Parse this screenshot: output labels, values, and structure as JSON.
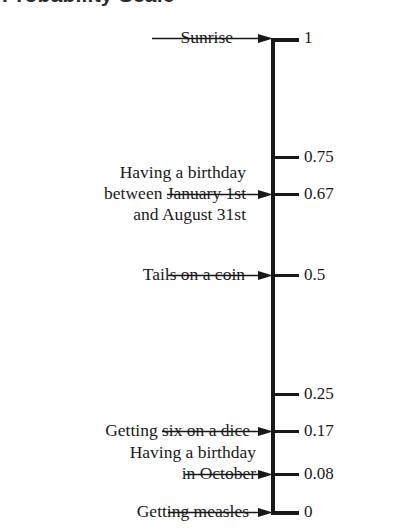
{
  "title": "Probability Scale",
  "axis": {
    "min": 0,
    "max": 1,
    "top_y": 38,
    "bottom_y": 512
  },
  "ticks": [
    {
      "value": 1,
      "label": "1"
    },
    {
      "value": 0.75,
      "label": "0.75"
    },
    {
      "value": 0.67,
      "label": "0.67"
    },
    {
      "value": 0.5,
      "label": "0.5"
    },
    {
      "value": 0.25,
      "label": "0.25"
    },
    {
      "value": 0.17,
      "label": "0.17"
    },
    {
      "value": 0.08,
      "label": "0.08"
    },
    {
      "value": 0,
      "label": "0"
    }
  ],
  "events": [
    {
      "name": "sunrise",
      "value": 1,
      "lines": [
        "Sunrise"
      ]
    },
    {
      "name": "birthday-jan-to-aug",
      "value": 0.67,
      "lines": [
        "Having a birthday",
        "between January 1st",
        "and August 31st"
      ]
    },
    {
      "name": "tails-on-a-coin",
      "value": 0.5,
      "lines": [
        "Tails on a coin"
      ]
    },
    {
      "name": "getting-six-on-a-dice",
      "value": 0.17,
      "lines": [
        "Getting six on a dice"
      ]
    },
    {
      "name": "birthday-in-october",
      "value": 0.08,
      "lines": [
        "Having a birthday",
        "in October"
      ]
    },
    {
      "name": "getting-measles",
      "value": 0,
      "lines": [
        "Getting measles"
      ]
    }
  ],
  "chart_data": {
    "type": "scatter",
    "title": "Probability Scale",
    "xlabel": "",
    "ylabel": "Probability",
    "ylim": [
      0,
      1
    ],
    "grid": false,
    "legend": "none",
    "axis_orientation": "vertical",
    "tick_values": [
      0,
      0.08,
      0.17,
      0.25,
      0.5,
      0.67,
      0.75,
      1
    ],
    "tick_labels": [
      "0",
      "0.08",
      "0.17",
      "0.25",
      "0.5",
      "0.67",
      "0.75",
      "1"
    ],
    "categories": [
      "Getting measles",
      "Having a birthday in October",
      "Getting six on a dice",
      "Tails on a coin",
      "Having a birthday between January 1st and August 31st",
      "Sunrise"
    ],
    "values": [
      0,
      0.08,
      0.17,
      0.5,
      0.67,
      1
    ],
    "unlabelled_ticks": [
      0.25,
      0.75
    ],
    "annotations": [
      {
        "text": "Sunrise",
        "value": 1
      },
      {
        "text": "Having a birthday between January 1st and August 31st",
        "value": 0.67
      },
      {
        "text": "Tails on a coin",
        "value": 0.5
      },
      {
        "text": "Getting six on a dice",
        "value": 0.17
      },
      {
        "text": "Having a birthday in October",
        "value": 0.08
      },
      {
        "text": "Getting measles",
        "value": 0
      }
    ]
  }
}
